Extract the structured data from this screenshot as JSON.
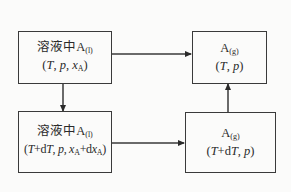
{
  "diagram": {
    "nodes": [
      {
        "id": "solution-initial",
        "species": "A",
        "prefix": "溶液中",
        "phase": "(l)",
        "state_vars": [
          "T",
          "p",
          "x_A"
        ],
        "line1": "溶液中A(l)",
        "line2": "(T, p, xA)"
      },
      {
        "id": "gas-initial",
        "species": "A",
        "prefix": "",
        "phase": "(g)",
        "state_vars": [
          "T",
          "p"
        ],
        "line1": "A(g)",
        "line2": "(T, p)"
      },
      {
        "id": "solution-perturbed",
        "species": "A",
        "prefix": "溶液中",
        "phase": "(l)",
        "state_vars": [
          "T+dT",
          "p",
          "x_A+dx_A"
        ],
        "line1": "溶液中A(l)",
        "line2": "(T+dT, p, xA+dxA)"
      },
      {
        "id": "gas-perturbed",
        "species": "A",
        "prefix": "",
        "phase": "(g)",
        "state_vars": [
          "T+dT",
          "p"
        ],
        "line1": "A(g)",
        "line2": "(T+dT, p)"
      }
    ],
    "edges": [
      {
        "from": "solution-initial",
        "to": "gas-initial",
        "direction": "right"
      },
      {
        "from": "solution-initial",
        "to": "solution-perturbed",
        "direction": "down"
      },
      {
        "from": "solution-perturbed",
        "to": "gas-perturbed",
        "direction": "right"
      },
      {
        "from": "gas-perturbed",
        "to": "gas-initial",
        "direction": "up"
      }
    ],
    "text": {
      "solution_prefix": "溶液中",
      "species": "A",
      "phase_liquid": "(l)",
      "phase_gas": "(g)",
      "T": "T",
      "p": "p",
      "x": "x",
      "x_sub": "A",
      "d": "d",
      "plus": "+",
      "comma": ", ",
      "lparen": "(",
      "rparen": ")"
    },
    "colors": {
      "line": "#3a3a3a",
      "background": "#fbfbfa",
      "text": "#2a2a2a"
    }
  }
}
